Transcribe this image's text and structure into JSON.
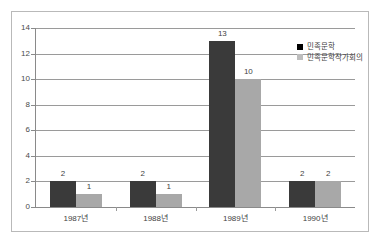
{
  "chart_data": {
    "type": "bar",
    "title": "",
    "subtitle": "",
    "xlabel": "",
    "ylabel": "",
    "categories": [
      "1987년",
      "1988년",
      "1989년",
      "1990년"
    ],
    "series": [
      {
        "name": "민족문학",
        "values": [
          2,
          2,
          13,
          2
        ],
        "color": "#3a3a3a"
      },
      {
        "name": "민족문학작가회의",
        "values": [
          1,
          1,
          10,
          2
        ],
        "color": "#a8a8a8"
      }
    ],
    "ylim": [
      0,
      14
    ],
    "yticks": [
      0,
      2,
      4,
      6,
      8,
      10,
      12,
      14
    ],
    "ytick_labels": [
      "0",
      "2",
      "4",
      "6",
      "8",
      "10",
      "12",
      "14"
    ],
    "grid": true,
    "grid_axis": "y",
    "legend_position": "top-right",
    "data_labels": true,
    "data_label_values": [
      [
        "2",
        "1"
      ],
      [
        "2",
        "1"
      ],
      [
        "13",
        "10"
      ],
      [
        "2",
        "2"
      ]
    ],
    "background_color": "#ffffff",
    "frame_color": "#b9b9b9"
  }
}
